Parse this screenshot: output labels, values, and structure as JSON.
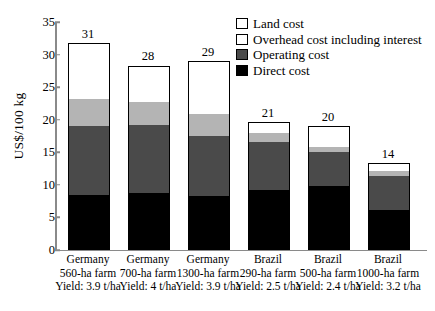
{
  "chart_data": {
    "type": "bar",
    "subtype": "stacked-bar",
    "title": "",
    "xlabel": "",
    "ylabel": "US$/100 kg",
    "ylim": [
      0,
      35
    ],
    "yticks": [
      0,
      5,
      10,
      15,
      20,
      25,
      30,
      35
    ],
    "grid": false,
    "legend_position": "top-right",
    "categories": [
      "Germany 560-ha farm",
      "Germany 700-ha farm",
      "Germany 1300-ha farm",
      "Brazil 290-ha farm",
      "Brazil 500-ha farm",
      "Brazil 1000-ha farm"
    ],
    "series": [
      {
        "name": "Direct cost",
        "color": "#000000",
        "values": [
          8.3,
          8.6,
          8.2,
          9.0,
          9.6,
          6.0
        ]
      },
      {
        "name": "Operating cost",
        "color": "#4a4a4a",
        "values": [
          10.6,
          10.5,
          9.2,
          7.4,
          5.3,
          5.2
        ]
      },
      {
        "name": "Overhead cost including interest",
        "color": "#b4b4b4",
        "values": [
          4.1,
          3.5,
          3.4,
          1.4,
          0.8,
          0.8
        ]
      },
      {
        "name": "Land cost",
        "color": "#ffffff",
        "values": [
          8.4,
          5.4,
          7.9,
          1.5,
          3.0,
          1.0
        ]
      }
    ],
    "totals": [
      31,
      28,
      29,
      21,
      20,
      14
    ],
    "data_labels": [
      "31",
      "28",
      "29",
      "21",
      "20",
      "14"
    ]
  },
  "axis": {
    "y_title": "US$/100 kg",
    "y_tick_labels": [
      "0",
      "5",
      "10",
      "15",
      "20",
      "25",
      "30",
      "35"
    ]
  },
  "legend": {
    "items": [
      {
        "label": "Land cost",
        "swatch": "land"
      },
      {
        "label": "Overhead cost including interest",
        "swatch": "overhead-l"
      },
      {
        "label": "Operating cost",
        "swatch": "operating-l"
      },
      {
        "label": "Direct cost",
        "swatch": "direct-l"
      }
    ]
  },
  "bars": [
    {
      "value_label": "31",
      "country": "Germany",
      "farm": "560-ha farm",
      "yield": "Yield: 3.9 t/ha"
    },
    {
      "value_label": "28",
      "country": "Germany",
      "farm": "700-ha farm",
      "yield": "Yield: 4 t/ha"
    },
    {
      "value_label": "29",
      "country": "Germany",
      "farm": "1300-ha farm",
      "yield": "Yield: 3.9 t/ha"
    },
    {
      "value_label": "21",
      "country": "Brazil",
      "farm": "290-ha farm",
      "yield": "Yield: 2.5 t/ha"
    },
    {
      "value_label": "20",
      "country": "Brazil",
      "farm": "500-ha farm",
      "yield": "Yield: 2.4 t/ha"
    },
    {
      "value_label": "14",
      "country": "Brazil",
      "farm": "1000-ha farm",
      "yield": "Yield: 3.2 t/ha"
    }
  ]
}
